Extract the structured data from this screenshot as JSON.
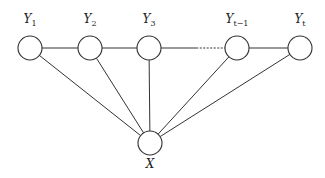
{
  "diagram": {
    "title": "",
    "nodes": [
      {
        "id": "Y1",
        "name": "Y",
        "sub": "1",
        "x": 30,
        "y": 48
      },
      {
        "id": "Y2",
        "name": "Y",
        "sub": "2",
        "x": 90,
        "y": 48
      },
      {
        "id": "Y3",
        "name": "Y",
        "sub": "3",
        "x": 149,
        "y": 48
      },
      {
        "id": "Yt-1",
        "name": "Y",
        "sub": "t−1",
        "x": 237,
        "y": 48
      },
      {
        "id": "Yt",
        "name": "Y",
        "sub": "t",
        "x": 300,
        "y": 48
      },
      {
        "id": "X",
        "name": "X",
        "sub": "",
        "x": 150,
        "y": 143
      }
    ],
    "edges": [
      {
        "from": "Y1",
        "to": "Y2",
        "style": "solid"
      },
      {
        "from": "Y2",
        "to": "Y3",
        "style": "solid"
      },
      {
        "from": "Y3",
        "to": "Yt-1",
        "style": "solid-then-dotted"
      },
      {
        "from": "Yt-1",
        "to": "Yt",
        "style": "solid"
      },
      {
        "from": "X",
        "to": "Y1",
        "style": "solid"
      },
      {
        "from": "X",
        "to": "Y2",
        "style": "solid"
      },
      {
        "from": "X",
        "to": "Y3",
        "style": "solid"
      },
      {
        "from": "X",
        "to": "Yt-1",
        "style": "solid"
      },
      {
        "from": "X",
        "to": "Yt",
        "style": "solid"
      }
    ],
    "node_radius": 12,
    "stroke_color": "#333333"
  }
}
